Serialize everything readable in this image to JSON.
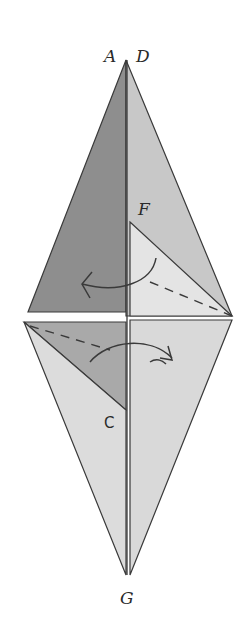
{
  "figure": {
    "type": "origami-fold-diagram",
    "background": "#ffffff",
    "labels": {
      "A": "A",
      "D": "D",
      "F": "F",
      "C": "C",
      "G": "G"
    },
    "colors": {
      "dark_face": "#8e8e8e",
      "mid_face": "#b9b9b9",
      "light_face": "#d6d6d6",
      "pale_face": "#e2e2e2",
      "lower_face": "#dadada",
      "line": "#3a3a3a"
    }
  }
}
